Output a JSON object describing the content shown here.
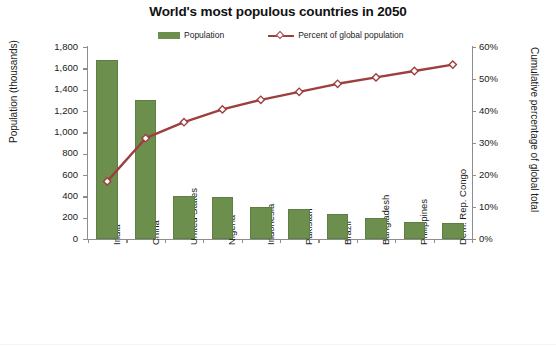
{
  "chart_data": {
    "type": "bar",
    "title": "World's most populous countries in 2050",
    "xlabel": "",
    "ylabel": "Population (thousands)",
    "y2label": "Cumulative percentage of global total",
    "ylim": [
      0,
      1800
    ],
    "y2lim": [
      0,
      60
    ],
    "grid": false,
    "legend_position": "top-center",
    "categories": [
      "India",
      "China",
      "United States",
      "Nigeria",
      "Indonesia",
      "Pakistan",
      "Brazil",
      "Bangladesh",
      "Philippines",
      "Dem. Rep. Congo"
    ],
    "series": [
      {
        "name": "Population",
        "type": "bar",
        "axis": "left",
        "unit": "thousands",
        "color": "#6d8f4e",
        "values": [
          1680,
          1300,
          400,
          395,
          300,
          285,
          235,
          200,
          160,
          150
        ]
      },
      {
        "name": "Percent of global population",
        "type": "line",
        "axis": "right",
        "unit": "%",
        "color": "#9d3f3f",
        "values": [
          18.0,
          31.5,
          36.5,
          40.5,
          43.5,
          46.0,
          48.5,
          50.5,
          52.5,
          54.5
        ]
      }
    ],
    "yticks": [
      "0",
      "200",
      "400",
      "600",
      "800",
      "1,000",
      "1,200",
      "1,400",
      "1,600",
      "1,800"
    ],
    "y2ticks": [
      "0%",
      "10%",
      "20%",
      "30%",
      "40%",
      "50%",
      "60%"
    ]
  },
  "legend": {
    "items": [
      {
        "label": "Population",
        "marker": "bar-swatch-icon"
      },
      {
        "label": "Percent of global population",
        "marker": "line-diamond-icon"
      }
    ]
  }
}
